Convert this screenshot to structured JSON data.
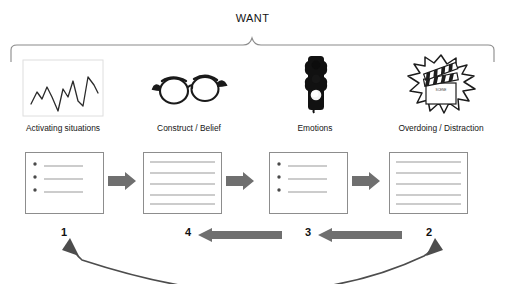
{
  "diagram": {
    "title": "WANT",
    "brace": {
      "name": "top-curly-brace",
      "color": "#8a8a8a"
    },
    "columns": [
      {
        "id": "activating-situations",
        "label": "Activating situations",
        "icon": "zigzag-chart-icon",
        "step_number": "1",
        "box_type": "bulleted-list",
        "bullets": 3
      },
      {
        "id": "construct-belief",
        "label": "Construct / Belief",
        "icon": "eyeglasses-icon",
        "step_number": "4",
        "box_type": "lined-page",
        "lines": 5
      },
      {
        "id": "emotions",
        "label": "Emotions",
        "icon": "traffic-light-icon",
        "step_number": "3",
        "box_type": "bulleted-list",
        "bullets": 3
      },
      {
        "id": "overdoing-distraction",
        "label": "Overdoing / Distraction",
        "icon": "clapperboard-burst-icon",
        "step_number": "2",
        "box_type": "lined-page",
        "lines": 5
      }
    ],
    "forward_arrows": [
      {
        "name": "forward-arrow-1",
        "direction": "right"
      },
      {
        "name": "forward-arrow-2",
        "direction": "right"
      },
      {
        "name": "forward-arrow-3",
        "direction": "right"
      }
    ],
    "feedback_arrows": [
      {
        "name": "feedback-arrow-4",
        "direction": "left"
      },
      {
        "name": "feedback-arrow-3",
        "direction": "left"
      }
    ],
    "curved_arrow": {
      "name": "curved-double-arrow",
      "direction": "double",
      "from": "2",
      "to": "1"
    },
    "colors": {
      "arrow_gray": "#6f6f6f",
      "box_border": "#8d8d8d",
      "line_gray": "#9a9a9a",
      "brace_gray": "#8a8a8a",
      "text": "#141414"
    }
  }
}
